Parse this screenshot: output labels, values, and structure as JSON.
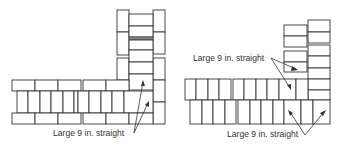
{
  "figures": [
    {
      "id": "left-corner",
      "label": "Large 9 in. straight",
      "description": "L-shaped brick wall corner, plan view, with vertical column on right and horizontal wall running left"
    },
    {
      "id": "right-corner",
      "label_top": "Large 9 in. straight",
      "label_bottom": "Large 9 in. straight",
      "description": "Stepped brick corner with two-course wall and offset vertical stacks"
    }
  ],
  "colors": {
    "line": "#333333",
    "background": "#ffffff"
  }
}
